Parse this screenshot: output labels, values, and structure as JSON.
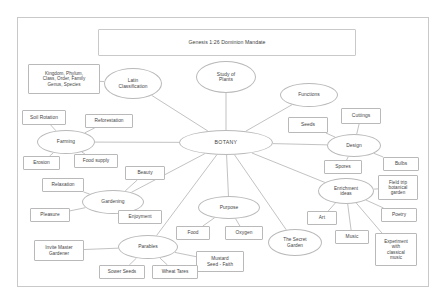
{
  "document": {
    "title_banner": "Genesis 1:26 Dominion Mandate",
    "center_node": "BOTANY",
    "frame": {
      "border_color": "#c9c9c9",
      "fill": "#ffffff"
    },
    "node_style": {
      "border_color": "#b9b9b9",
      "fill": "#ffffff",
      "text_color": "#3f3f3f"
    },
    "edge_color": "#a8a8a8"
  },
  "nodes": [
    {
      "id": "title",
      "label": "Genesis 1:26 Dominion Mandate",
      "shape": "rect",
      "x": 98,
      "y": 29,
      "w": 258,
      "h": 27,
      "fs": 5.2
    },
    {
      "id": "taxonomy",
      "label": "Kingdom, Phylum,\nClass, Order, Family\nGenus, Species",
      "shape": "rect",
      "x": 28,
      "y": 64,
      "w": 72,
      "h": 30,
      "fs": 4.6
    },
    {
      "id": "latin",
      "label": "Latin\nClassification",
      "shape": "ellipse",
      "x": 104,
      "y": 68,
      "w": 58,
      "h": 31,
      "fs": 4.8
    },
    {
      "id": "study",
      "label": "Study of\nPlants",
      "shape": "ellipse",
      "x": 196,
      "y": 61,
      "w": 60,
      "h": 32,
      "fs": 4.9
    },
    {
      "id": "functions",
      "label": "Functions",
      "shape": "ellipse",
      "x": 280,
      "y": 83,
      "w": 58,
      "h": 24,
      "fs": 4.9
    },
    {
      "id": "soil",
      "label": "Soil Rotation",
      "shape": "rect",
      "x": 22,
      "y": 110,
      "w": 44,
      "h": 15,
      "fs": 4.8
    },
    {
      "id": "reforest",
      "label": "Reforestation",
      "shape": "rect",
      "x": 85,
      "y": 114,
      "w": 48,
      "h": 14,
      "fs": 4.8
    },
    {
      "id": "cuttings",
      "label": "Cuttings",
      "shape": "rect",
      "x": 341,
      "y": 108,
      "w": 40,
      "h": 16,
      "fs": 4.9
    },
    {
      "id": "seeds",
      "label": "Seeds",
      "shape": "rect",
      "x": 288,
      "y": 117,
      "w": 40,
      "h": 16,
      "fs": 4.9
    },
    {
      "id": "farming",
      "label": "Farming",
      "shape": "ellipse",
      "x": 37,
      "y": 130,
      "w": 58,
      "h": 24,
      "fs": 4.9
    },
    {
      "id": "botany",
      "label": "BOTANY",
      "shape": "ellipse",
      "x": 179,
      "y": 130,
      "w": 94,
      "h": 25,
      "fs": 5.2
    },
    {
      "id": "design",
      "label": "Design",
      "shape": "ellipse",
      "x": 327,
      "y": 134,
      "w": 54,
      "h": 23,
      "fs": 4.9
    },
    {
      "id": "erosion",
      "label": "Erosion",
      "shape": "rect",
      "x": 23,
      "y": 156,
      "w": 37,
      "h": 14,
      "fs": 4.8
    },
    {
      "id": "foodsupply",
      "label": "Food supply",
      "shape": "rect",
      "x": 74,
      "y": 154,
      "w": 44,
      "h": 14,
      "fs": 4.8
    },
    {
      "id": "spores",
      "label": "Spores",
      "shape": "rect",
      "x": 324,
      "y": 160,
      "w": 38,
      "h": 14,
      "fs": 4.8
    },
    {
      "id": "bulbs",
      "label": "Bulbs",
      "shape": "rect",
      "x": 383,
      "y": 157,
      "w": 36,
      "h": 14,
      "fs": 4.8
    },
    {
      "id": "beauty",
      "label": "Beauty",
      "shape": "rect",
      "x": 125,
      "y": 166,
      "w": 40,
      "h": 14,
      "fs": 4.8
    },
    {
      "id": "relaxation",
      "label": "Relaxation",
      "shape": "rect",
      "x": 42,
      "y": 178,
      "w": 42,
      "h": 14,
      "fs": 4.8
    },
    {
      "id": "enrichment",
      "label": "Enrichment\nideas",
      "shape": "ellipse",
      "x": 318,
      "y": 178,
      "w": 56,
      "h": 26,
      "fs": 4.7
    },
    {
      "id": "fieldtrip",
      "label": "Field trip\nbotanical\ngarden",
      "shape": "rect",
      "x": 378,
      "y": 175,
      "w": 40,
      "h": 25,
      "fs": 4.6
    },
    {
      "id": "gardening",
      "label": "Gardening",
      "shape": "ellipse",
      "x": 82,
      "y": 190,
      "w": 62,
      "h": 24,
      "fs": 4.9
    },
    {
      "id": "purpose",
      "label": "Purpose",
      "shape": "ellipse",
      "x": 198,
      "y": 196,
      "w": 62,
      "h": 23,
      "fs": 4.9
    },
    {
      "id": "poetry",
      "label": "Poetry",
      "shape": "rect",
      "x": 381,
      "y": 208,
      "w": 36,
      "h": 14,
      "fs": 4.8
    },
    {
      "id": "pleasure",
      "label": "Pleasure",
      "shape": "rect",
      "x": 30,
      "y": 208,
      "w": 40,
      "h": 14,
      "fs": 4.8
    },
    {
      "id": "enjoyment",
      "label": "Enjoyment",
      "shape": "rect",
      "x": 118,
      "y": 210,
      "w": 44,
      "h": 14,
      "fs": 4.8
    },
    {
      "id": "art",
      "label": "Art",
      "shape": "rect",
      "x": 307,
      "y": 211,
      "w": 30,
      "h": 14,
      "fs": 4.8
    },
    {
      "id": "food",
      "label": "Food",
      "shape": "rect",
      "x": 176,
      "y": 226,
      "w": 34,
      "h": 14,
      "fs": 4.8
    },
    {
      "id": "oxygen",
      "label": "Oxygen",
      "shape": "rect",
      "x": 225,
      "y": 226,
      "w": 38,
      "h": 14,
      "fs": 4.8
    },
    {
      "id": "music",
      "label": "Music",
      "shape": "rect",
      "x": 335,
      "y": 230,
      "w": 34,
      "h": 14,
      "fs": 4.8
    },
    {
      "id": "secretgarden",
      "label": "The Secret\nGarden",
      "shape": "ellipse",
      "x": 268,
      "y": 229,
      "w": 54,
      "h": 27,
      "fs": 4.7
    },
    {
      "id": "experiment",
      "label": "Experiment\nwith\nclassical\nmusic",
      "shape": "rect",
      "x": 375,
      "y": 233,
      "w": 42,
      "h": 33,
      "fs": 4.6
    },
    {
      "id": "parables",
      "label": "Parables",
      "shape": "ellipse",
      "x": 118,
      "y": 235,
      "w": 60,
      "h": 24,
      "fs": 4.9
    },
    {
      "id": "invite",
      "label": "Invite Master\nGardener",
      "shape": "rect",
      "x": 34,
      "y": 240,
      "w": 50,
      "h": 21,
      "fs": 4.7
    },
    {
      "id": "mustard",
      "label": "Mustard\nSeed - Faith",
      "shape": "rect",
      "x": 196,
      "y": 251,
      "w": 48,
      "h": 21,
      "fs": 4.7
    },
    {
      "id": "sower",
      "label": "Sower Seeds",
      "shape": "rect",
      "x": 99,
      "y": 265,
      "w": 46,
      "h": 14,
      "fs": 4.7
    },
    {
      "id": "wheat",
      "label": "Wheat Tares",
      "shape": "rect",
      "x": 152,
      "y": 265,
      "w": 46,
      "h": 14,
      "fs": 4.7
    }
  ],
  "edges": [
    {
      "from": "botany",
      "to": "latin"
    },
    {
      "from": "botany",
      "to": "study"
    },
    {
      "from": "botany",
      "to": "functions"
    },
    {
      "from": "botany",
      "to": "farming"
    },
    {
      "from": "botany",
      "to": "design"
    },
    {
      "from": "botany",
      "to": "gardening"
    },
    {
      "from": "botany",
      "to": "purpose"
    },
    {
      "from": "botany",
      "to": "parables"
    },
    {
      "from": "botany",
      "to": "secretgarden"
    },
    {
      "from": "botany",
      "to": "enrichment"
    },
    {
      "from": "latin",
      "to": "taxonomy"
    },
    {
      "from": "farming",
      "to": "soil"
    },
    {
      "from": "farming",
      "to": "reforest"
    },
    {
      "from": "farming",
      "to": "erosion"
    },
    {
      "from": "farming",
      "to": "foodsupply"
    },
    {
      "from": "design",
      "to": "seeds"
    },
    {
      "from": "design",
      "to": "cuttings"
    },
    {
      "from": "design",
      "to": "spores"
    },
    {
      "from": "design",
      "to": "bulbs"
    },
    {
      "from": "gardening",
      "to": "relaxation"
    },
    {
      "from": "gardening",
      "to": "beauty"
    },
    {
      "from": "gardening",
      "to": "pleasure"
    },
    {
      "from": "gardening",
      "to": "enjoyment"
    },
    {
      "from": "purpose",
      "to": "food"
    },
    {
      "from": "purpose",
      "to": "oxygen"
    },
    {
      "from": "parables",
      "to": "sower"
    },
    {
      "from": "parables",
      "to": "wheat"
    },
    {
      "from": "parables",
      "to": "mustard"
    },
    {
      "from": "parables",
      "to": "invite"
    },
    {
      "from": "enrichment",
      "to": "art"
    },
    {
      "from": "enrichment",
      "to": "music"
    },
    {
      "from": "enrichment",
      "to": "fieldtrip"
    },
    {
      "from": "enrichment",
      "to": "poetry"
    },
    {
      "from": "enrichment",
      "to": "experiment"
    }
  ]
}
